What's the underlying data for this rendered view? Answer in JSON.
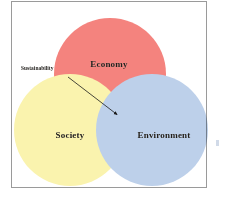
{
  "figure": {
    "type": "venn-3-circle",
    "background_color": "#ffffff",
    "frame_color": "#9a9a9a"
  },
  "circles": [
    {
      "id": "economy",
      "label": "Economy",
      "color": "#F4837E",
      "position": "top",
      "cx": 98,
      "cy": 72,
      "r": 56
    },
    {
      "id": "society",
      "label": "Society",
      "color": "#FAF3AE",
      "position": "bottom-left",
      "cx": 58,
      "cy": 128,
      "r": 56
    },
    {
      "id": "environment",
      "label": "Environment",
      "color": "#BDD0EA",
      "position": "bottom-right",
      "cx": 140,
      "cy": 128,
      "r": 56
    }
  ],
  "annotation": {
    "label": "Sustainability",
    "target": "center-intersection",
    "arrow_color": "#1a1a1a",
    "arrow_start_x": 56,
    "arrow_start_y": 75,
    "arrow_end_x": 107,
    "arrow_end_y": 114
  },
  "margin_mark": {
    "name": "page-edge-mark",
    "color": "#c9d4e4"
  }
}
